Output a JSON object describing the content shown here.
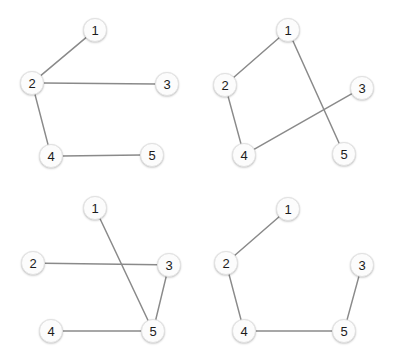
{
  "figure": {
    "title": "",
    "background_color": "#ffffff",
    "node_fill": "#fcfcfc",
    "node_stroke": "#e2e2e2",
    "node_label_color": "#1b1b1b",
    "edge_color": "#8a8a8a",
    "edge_width": 1.5,
    "node_radius": 12
  },
  "chart_data": {
    "type": "diagram",
    "subtype": "node-link-graph-grid",
    "title": "",
    "xlabel": "",
    "ylabel": "",
    "layout": {
      "rows": 2,
      "cols": 2,
      "panel_width": 199,
      "panel_height": 181
    },
    "panels": [
      {
        "id": "panel-top-left",
        "origin": [
          0,
          0
        ],
        "nodes": [
          {
            "id": "1",
            "label": "1",
            "x": 95,
            "y": 30
          },
          {
            "id": "2",
            "label": "2",
            "x": 32,
            "y": 83
          },
          {
            "id": "3",
            "label": "3",
            "x": 167,
            "y": 84
          },
          {
            "id": "4",
            "label": "4",
            "x": 51,
            "y": 156
          },
          {
            "id": "5",
            "label": "5",
            "x": 152,
            "y": 155
          }
        ],
        "edges": [
          {
            "from": "1",
            "to": "2"
          },
          {
            "from": "2",
            "to": "3"
          },
          {
            "from": "2",
            "to": "4"
          },
          {
            "from": "4",
            "to": "5"
          }
        ]
      },
      {
        "id": "panel-top-right",
        "origin": [
          198,
          0
        ],
        "nodes": [
          {
            "id": "1",
            "label": "1",
            "x": 90,
            "y": 30
          },
          {
            "id": "2",
            "label": "2",
            "x": 27,
            "y": 85
          },
          {
            "id": "3",
            "label": "3",
            "x": 164,
            "y": 88
          },
          {
            "id": "4",
            "label": "4",
            "x": 46,
            "y": 155
          },
          {
            "id": "5",
            "label": "5",
            "x": 146,
            "y": 154
          }
        ],
        "edges": [
          {
            "from": "1",
            "to": "2"
          },
          {
            "from": "2",
            "to": "4"
          },
          {
            "from": "1",
            "to": "5"
          },
          {
            "from": "3",
            "to": "4"
          }
        ]
      },
      {
        "id": "panel-bottom-left",
        "origin": [
          0,
          180
        ],
        "nodes": [
          {
            "id": "1",
            "label": "1",
            "x": 95,
            "y": 28
          },
          {
            "id": "2",
            "label": "2",
            "x": 33,
            "y": 83
          },
          {
            "id": "3",
            "label": "3",
            "x": 169,
            "y": 85
          },
          {
            "id": "4",
            "label": "4",
            "x": 51,
            "y": 151
          },
          {
            "id": "5",
            "label": "5",
            "x": 153,
            "y": 151
          }
        ],
        "edges": [
          {
            "from": "2",
            "to": "3"
          },
          {
            "from": "1",
            "to": "5"
          },
          {
            "from": "3",
            "to": "5"
          },
          {
            "from": "4",
            "to": "5"
          }
        ]
      },
      {
        "id": "panel-bottom-right",
        "origin": [
          198,
          180
        ],
        "nodes": [
          {
            "id": "1",
            "label": "1",
            "x": 90,
            "y": 29
          },
          {
            "id": "2",
            "label": "2",
            "x": 28,
            "y": 83
          },
          {
            "id": "3",
            "label": "3",
            "x": 164,
            "y": 85
          },
          {
            "id": "4",
            "label": "4",
            "x": 46,
            "y": 151
          },
          {
            "id": "5",
            "label": "5",
            "x": 146,
            "y": 151
          }
        ],
        "edges": [
          {
            "from": "1",
            "to": "2"
          },
          {
            "from": "2",
            "to": "4"
          },
          {
            "from": "4",
            "to": "5"
          },
          {
            "from": "5",
            "to": "3"
          }
        ]
      }
    ]
  }
}
